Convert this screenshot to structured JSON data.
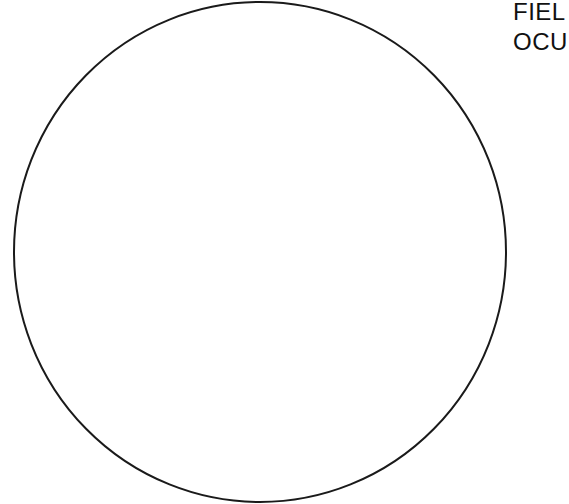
{
  "diagram": {
    "shape": "circle",
    "stroke_color": "#1a1a1a",
    "fill_color": "#ffffff",
    "stroke_width": 2,
    "center": [
      260,
      252
    ],
    "radius_x": 246,
    "radius_y": 250
  },
  "labels": {
    "line1": "FIEL",
    "line2": "OCU"
  }
}
